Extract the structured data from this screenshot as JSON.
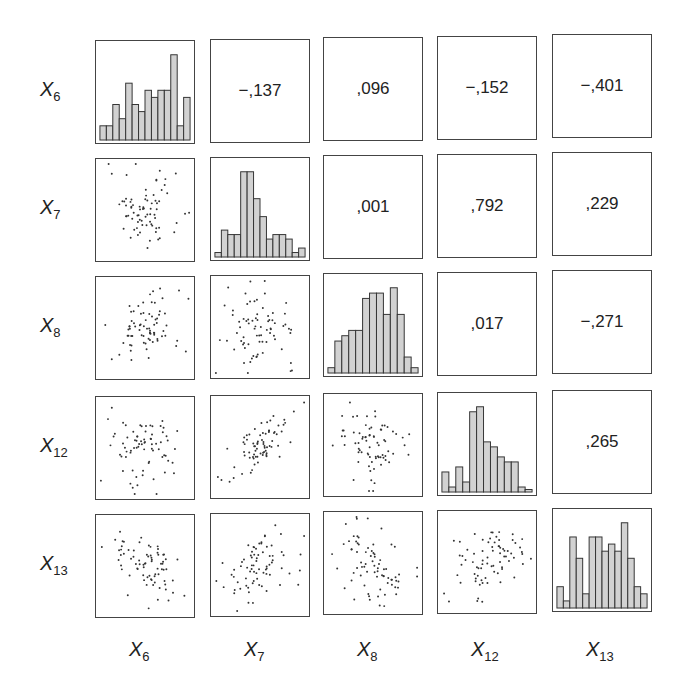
{
  "chart_data": {
    "type": "scatter_matrix",
    "title": "",
    "variables": [
      "X6",
      "X7",
      "X8",
      "X12",
      "X13"
    ],
    "row_labels": [
      {
        "base": "X",
        "sub": "6"
      },
      {
        "base": "X",
        "sub": "7"
      },
      {
        "base": "X",
        "sub": "8"
      },
      {
        "base": "X",
        "sub": "12"
      },
      {
        "base": "X",
        "sub": "13"
      }
    ],
    "col_labels": [
      {
        "base": "X",
        "sub": "6"
      },
      {
        "base": "X",
        "sub": "7"
      },
      {
        "base": "X",
        "sub": "8"
      },
      {
        "base": "X",
        "sub": "12"
      },
      {
        "base": "X",
        "sub": "13"
      }
    ],
    "correlations_upper": [
      [
        "",
        "−,137",
        ",096",
        "−,152",
        "−,401"
      ],
      [
        "",
        "",
        ",001",
        ",792",
        ",229"
      ],
      [
        "",
        "",
        "",
        ",017",
        "−,271"
      ],
      [
        "",
        "",
        "",
        "",
        ",265"
      ],
      [
        "",
        "",
        "",
        "",
        ""
      ]
    ],
    "correlation_values": {
      "X6_X7": -0.137,
      "X6_X8": 0.096,
      "X6_X12": -0.152,
      "X6_X13": -0.401,
      "X7_X8": 0.001,
      "X7_X12": 0.792,
      "X7_X13": 0.229,
      "X8_X12": 0.017,
      "X8_X13": -0.271,
      "X12_X13": 0.265
    },
    "diagonal_histograms": {
      "X6": [
        2,
        2,
        5,
        3,
        8,
        5,
        4,
        7,
        6,
        7,
        7,
        12,
        2,
        6
      ],
      "X7": [
        1,
        6,
        5,
        5,
        19,
        19,
        13,
        9,
        4,
        5,
        5,
        4,
        1,
        2
      ],
      "X8": [
        1,
        6,
        7,
        8,
        8,
        14,
        15,
        15,
        11,
        16,
        11,
        3,
        1
      ],
      "X12": [
        4,
        1,
        5,
        2,
        16,
        17,
        10,
        9,
        7,
        6,
        6,
        1,
        0.5
      ],
      "X13": [
        3,
        1,
        10,
        7,
        2,
        10,
        10,
        8,
        9,
        8,
        12,
        7,
        3,
        2
      ]
    },
    "lower_panels": "pairwise scatter plots",
    "grid": false,
    "legend": null
  }
}
